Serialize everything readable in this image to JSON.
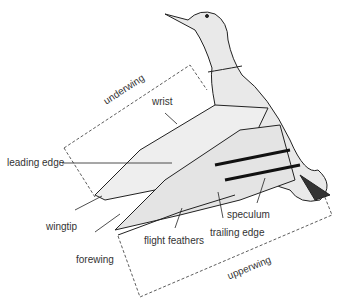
{
  "diagram": {
    "labels": {
      "underwing": "underwing",
      "wrist": "wrist",
      "leading_edge": "leading edge",
      "wingtip": "wingtip",
      "forewing": "forewing",
      "flight_feathers": "flight feathers",
      "trailing_edge": "trailing edge",
      "speculum": "speculum",
      "upperwing": "upperwing"
    }
  }
}
